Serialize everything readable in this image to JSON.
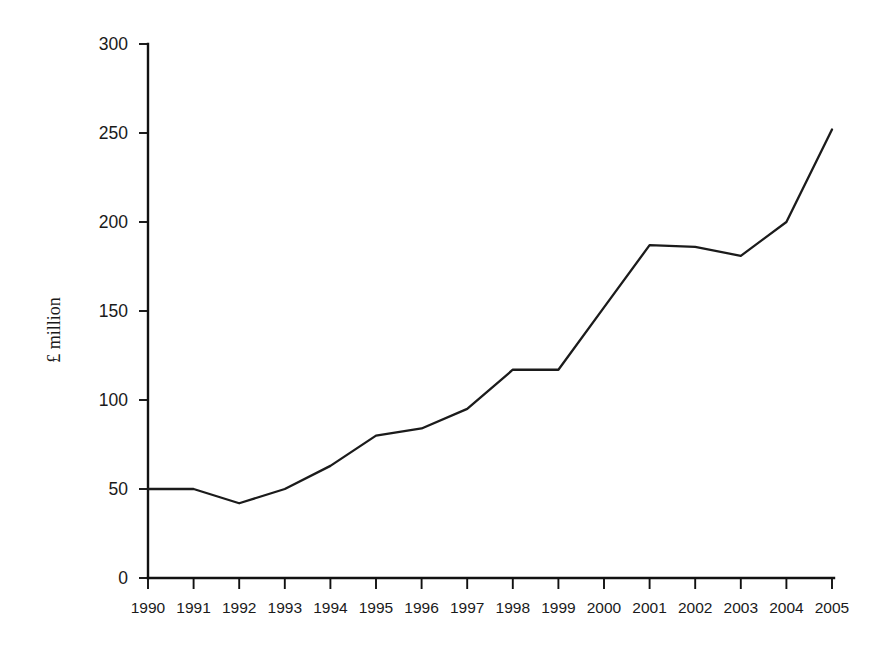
{
  "chart_data": {
    "type": "line",
    "title": "",
    "xlabel": "",
    "ylabel": "£ million",
    "categories": [
      "1990",
      "1991",
      "1992",
      "1993",
      "1994",
      "1995",
      "1996",
      "1997",
      "1998",
      "1999",
      "2000",
      "2001",
      "2002",
      "2003",
      "2004",
      "2005"
    ],
    "values": [
      50,
      50,
      42,
      50,
      63,
      80,
      84,
      95,
      117,
      117,
      152,
      187,
      186,
      181,
      200,
      252
    ],
    "series": [
      {
        "name": "£ million",
        "values": [
          50,
          50,
          42,
          50,
          63,
          80,
          84,
          95,
          117,
          117,
          152,
          187,
          186,
          181,
          200,
          252
        ]
      }
    ],
    "x_tick_labels": [
      "1990",
      "1991",
      "1992",
      "1993",
      "1994",
      "1995",
      "1996",
      "1997",
      "1998",
      "1999",
      "2000",
      "2001",
      "2002",
      "2003",
      "2004",
      "2005"
    ],
    "y_tick_labels": [
      "0",
      "50",
      "100",
      "150",
      "200",
      "250",
      "300"
    ],
    "y_tick_values": [
      0,
      50,
      100,
      150,
      200,
      250,
      300
    ],
    "ylim": [
      0,
      300
    ],
    "xlim": [
      "1990",
      "2005"
    ],
    "grid": false,
    "legend": false,
    "legend_position": "none",
    "line_color": "#1b1b1b",
    "background_color": "#ffffff",
    "axis_color": "#111111"
  },
  "axes": {
    "y_axis_label": "£ million"
  }
}
